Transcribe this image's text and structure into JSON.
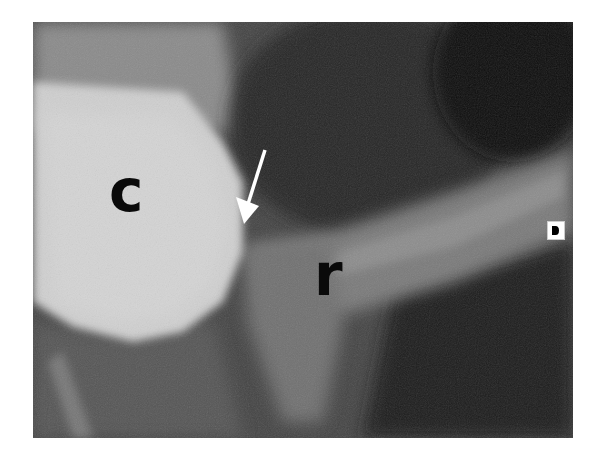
{
  "figure": {
    "labels": {
      "c": "c",
      "r": "r"
    },
    "annotations": {
      "arrow": "arrow pointing down-left to contact point between c and r",
      "corner_marker": "orientation marker"
    },
    "colors": {
      "background": "#ffffff",
      "label_color": "#0a0a0a",
      "arrow_color": "#ffffff"
    }
  }
}
